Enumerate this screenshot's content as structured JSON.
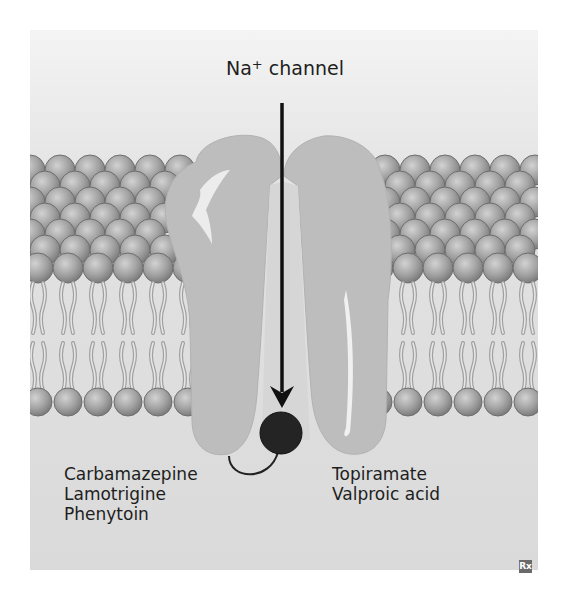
{
  "figure": {
    "title_prefix": "Na",
    "title_superscript": "+",
    "title_suffix": " channel",
    "left_binding_site_drugs": [
      "Carbamazepine",
      "Lamotrigine",
      "Phenytoin"
    ],
    "right_binding_site_drugs": [
      "Topiramate",
      "Valproic acid"
    ],
    "corner_badge": "Rx"
  },
  "colors": {
    "background": "#dcdcdc",
    "protein": "#bdbdbd",
    "lipid_head": "#9a9a9a",
    "lipid_tail": "#a8a8a8",
    "arrow": "#111111",
    "blocker_ball": "#222222"
  },
  "icons": {
    "arrow": "down-arrow-icon",
    "blocker": "blocker-ball-icon",
    "badge": "rx-icon"
  }
}
